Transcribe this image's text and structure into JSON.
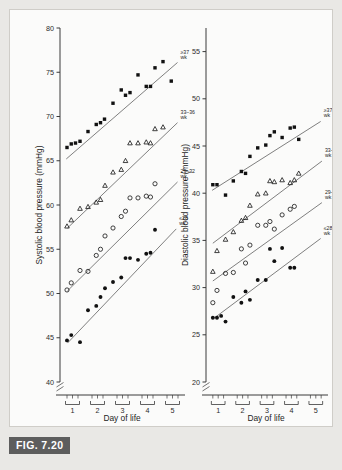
{
  "figure": {
    "caption_label": "FIG. 7.20",
    "background_color": "#e9e8e5",
    "panel_background": "#fbfbfa",
    "caption_bar_color": "#5d5d5d",
    "ink_color": "#111111"
  },
  "chart_data": [
    {
      "type": "scatter",
      "panel": "left",
      "title": "",
      "xlabel": "Day of life",
      "ylabel": "Systolic blood pressure (mmHg)",
      "xlim": [
        0.5,
        5.5
      ],
      "ylim": [
        40,
        80
      ],
      "yticks": [
        40,
        45,
        50,
        55,
        60,
        65,
        70,
        75,
        80
      ],
      "xticks": [
        1,
        2,
        3,
        4,
        5
      ],
      "xtick_labels": [
        "1",
        "2",
        "3",
        "4",
        "5"
      ],
      "grid": false,
      "legend_position": "inline-right-of-series",
      "axis_break_y": true,
      "series": [
        {
          "name": "≥37 wk",
          "marker": "filled-square",
          "label_line1": "≥37",
          "label_line2": "wk",
          "x": [
            0.78,
            0.95,
            1.12,
            1.3,
            1.62,
            1.95,
            2.12,
            2.28,
            2.62,
            2.95,
            3.12,
            3.3,
            3.62,
            3.95,
            4.12,
            4.3,
            4.62,
            4.95,
            5.12,
            5.3
          ],
          "y": [
            66.5,
            66.9,
            67.0,
            67.2,
            68.3,
            69.1,
            69.3,
            69.7,
            71.5,
            73.0,
            72.4,
            72.7,
            74.7,
            73.4,
            73.4,
            75.5,
            76.2,
            74.0
          ],
          "fit_x": [
            0.75,
            5.2
          ],
          "fit_y": [
            65.2,
            76.1
          ]
        },
        {
          "name": "33–36 wk",
          "marker": "open-triangle",
          "label_line1": "33–36",
          "label_line2": "wk",
          "x": [
            0.78,
            0.95,
            1.3,
            1.62,
            1.95,
            2.12,
            2.3,
            2.62,
            2.95,
            3.12,
            3.3,
            3.62,
            3.95,
            4.12,
            4.3,
            4.62,
            4.95,
            5.12,
            5.3
          ],
          "y": [
            57.6,
            58.3,
            59.6,
            59.8,
            60.3,
            60.6,
            62.2,
            63.7,
            64.0,
            65.0,
            67.0,
            67.0,
            67.1,
            67.0,
            68.6,
            68.8
          ],
          "fit_x": [
            0.8,
            5.2
          ],
          "fit_y": [
            57.4,
            69.3
          ]
        },
        {
          "name": "29–32 wk",
          "marker": "open-circle",
          "label_line1": "29–32",
          "label_line2": "wk",
          "x": [
            0.78,
            0.95,
            1.3,
            1.62,
            1.95,
            2.12,
            2.3,
            2.62,
            2.95,
            3.12,
            3.3,
            3.62,
            3.95,
            4.12,
            4.3,
            4.62,
            4.95,
            5.12,
            5.3
          ],
          "y": [
            50.4,
            51.2,
            52.6,
            52.5,
            54.3,
            55.0,
            56.5,
            57.4,
            58.7,
            59.3,
            60.8,
            60.8,
            61.0,
            60.9,
            62.4
          ],
          "fit_x": [
            0.8,
            5.2
          ],
          "fit_y": [
            50.3,
            62.6
          ]
        },
        {
          "name": "≤28 wk",
          "marker": "filled-circle",
          "label_line1": "≤28",
          "label_line2": "wk",
          "x": [
            0.78,
            0.95,
            1.3,
            1.62,
            1.95,
            2.12,
            2.3,
            2.62,
            2.95,
            3.12,
            3.3,
            3.62,
            3.95,
            4.12,
            4.3,
            4.62,
            4.95,
            5.12
          ],
          "y": [
            44.7,
            45.3,
            44.5,
            48.1,
            48.6,
            49.6,
            50.6,
            51.3,
            51.8,
            54.0,
            54.0,
            53.8,
            54.5,
            54.6,
            57.2
          ],
          "fit_x": [
            0.8,
            5.15
          ],
          "fit_y": [
            44.4,
            57.3
          ]
        }
      ]
    },
    {
      "type": "scatter",
      "panel": "right",
      "title": "",
      "xlabel": "Day of life",
      "ylabel": "Diastolic blood pressure (mmHg)",
      "xlim": [
        0.5,
        5.5
      ],
      "ylim": [
        20,
        57.5
      ],
      "yticks": [
        20,
        25,
        30,
        35,
        40,
        45,
        50,
        55
      ],
      "xticks": [
        1,
        2,
        3,
        4,
        5
      ],
      "xtick_labels": [
        "1",
        "2",
        "3",
        "4",
        "5"
      ],
      "grid": false,
      "legend_position": "inline-right-of-series",
      "axis_break_y": true,
      "series": [
        {
          "name": "≥37 wk",
          "marker": "filled-square",
          "label_line1": "≥37",
          "label_line2": "wk",
          "x": [
            0.78,
            0.95,
            1.3,
            1.62,
            1.95,
            2.12,
            2.3,
            2.62,
            2.95,
            3.12,
            3.3,
            3.62,
            3.95,
            4.12,
            4.3,
            4.62,
            4.95,
            5.12,
            5.3
          ],
          "y": [
            40.9,
            40.9,
            39.8,
            41.3,
            42.3,
            42.1,
            43.9,
            44.8,
            45.1,
            46.1,
            46.5,
            45.9,
            46.9,
            47.0,
            45.7
          ],
          "fit_x": [
            0.75,
            5.2
          ],
          "fit_y": [
            40.3,
            47.6
          ]
        },
        {
          "name": "33–36 wk",
          "marker": "open-triangle",
          "label_line1": "33–36",
          "label_line2": "wk",
          "x": [
            0.78,
            0.95,
            1.3,
            1.62,
            1.95,
            2.12,
            2.3,
            2.62,
            2.95,
            3.12,
            3.3,
            3.62,
            3.95,
            4.12,
            4.3,
            4.62,
            4.95,
            5.12,
            5.3
          ],
          "y": [
            31.7,
            33.9,
            35.1,
            35.9,
            37.1,
            37.4,
            38.7,
            39.9,
            40.0,
            41.3,
            41.2,
            41.4,
            41.1,
            41.4,
            42.1
          ],
          "fit_x": [
            0.78,
            5.25
          ],
          "fit_y": [
            34.7,
            43.4
          ]
        },
        {
          "name": "29–32 wk",
          "marker": "open-circle",
          "label_line1": "29–32",
          "label_line2": "wk",
          "x": [
            0.78,
            0.95,
            1.3,
            1.62,
            1.95,
            2.12,
            2.3,
            2.62,
            2.95,
            3.12,
            3.3,
            3.62,
            3.95,
            4.12,
            4.3,
            4.62,
            4.95,
            5.12,
            5.3
          ],
          "y": [
            28.4,
            29.7,
            31.5,
            31.6,
            34.1,
            32.6,
            34.5,
            36.6,
            36.6,
            37.0,
            36.2,
            37.7,
            38.3,
            38.6
          ],
          "fit_x": [
            0.78,
            5.25
          ],
          "fit_y": [
            30.7,
            39.0
          ]
        },
        {
          "name": "≤28 wk",
          "marker": "filled-circle",
          "label_line1": "≤28",
          "label_line2": "wk",
          "x": [
            0.78,
            0.95,
            1.12,
            1.3,
            1.62,
            1.95,
            2.12,
            2.3,
            2.62,
            2.95,
            3.12,
            3.3,
            3.62,
            3.95,
            4.12,
            4.3,
            4.62,
            4.95,
            5.12
          ],
          "y": [
            26.8,
            26.8,
            27.0,
            26.4,
            29.0,
            28.4,
            29.6,
            28.7,
            30.8,
            30.8,
            34.1,
            32.8,
            34.2,
            32.1,
            32.1
          ],
          "fit_x": [
            0.8,
            5.2
          ],
          "fit_y": [
            26.7,
            35.2
          ]
        }
      ]
    }
  ],
  "axes_common": {
    "x_axis_title": "Day of life",
    "day_bracket_count": 5,
    "points_per_day": 3
  }
}
